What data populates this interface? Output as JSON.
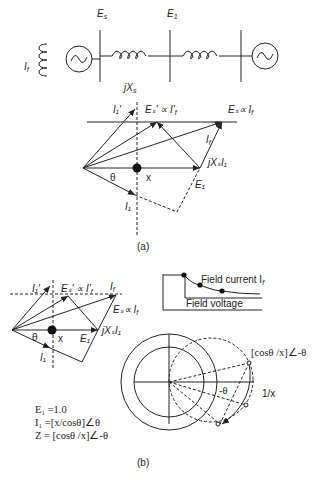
{
  "circuit": {
    "labels": {
      "field_current": "I",
      "field_current_sub": "f",
      "bus_es": "E",
      "bus_es_sub": "s",
      "bus_e1": "E",
      "bus_e1_sub": "1",
      "reactance": "jX",
      "reactance_sub": "s"
    }
  },
  "diagram_a": {
    "caption": "(a)",
    "labels": {
      "i1_prime": "I₁′",
      "es_prime": "Eₛ′ ∝ I′",
      "es_prime_sub": "f",
      "es_if": "Eₛ∝ I",
      "es_if_sub": "f",
      "if": "I",
      "if_sub": "f",
      "jxs_i1": "jXₛI₁",
      "x": "x",
      "theta": "θ",
      "e1": "E₁",
      "i1": "I₁"
    }
  },
  "diagram_b": {
    "caption": "(b)",
    "labels": {
      "i1_prime": "I₁′",
      "es_prime": "Eₛ′ ∝ I′",
      "es_prime_sub": "f",
      "if": "I",
      "if_sub": "f",
      "es_if": "Eₛ∝ I",
      "es_if_sub": "f",
      "jxs_i1": "jXₛI₁",
      "theta": "θ",
      "x": "x",
      "e1": "E₁",
      "i1": "I₁"
    },
    "field_chart": {
      "curve_label": "Field current I",
      "curve_label_sub": "f",
      "axis_label": "Field voltage"
    },
    "circle_chart": {
      "impedance_label": "[cosθ /x]∠-θ",
      "angle_label": "-θ",
      "radius_label": "1/x"
    },
    "equations": [
      "E₁ =1.0",
      "I₁ =[x/cosθ]∠θ",
      "Z = [cosθ /x]∠-θ"
    ]
  }
}
